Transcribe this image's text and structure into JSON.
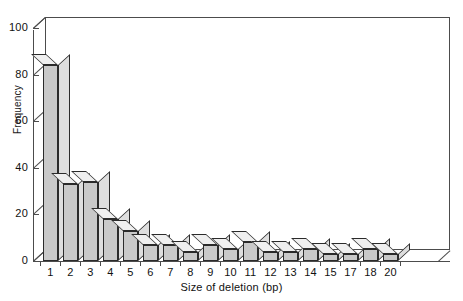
{
  "chart_data": {
    "type": "bar",
    "title": "",
    "xlabel": "Size of deletion (bp)",
    "ylabel": "Frequency",
    "categories": [
      "1",
      "2",
      "3",
      "4",
      "5",
      "6",
      "7",
      "8",
      "9",
      "10",
      "11",
      "12",
      "13",
      "14",
      "15",
      "17",
      "18",
      "20"
    ],
    "values": [
      84,
      33,
      34,
      18,
      13,
      7,
      7,
      4,
      7,
      5,
      8,
      4,
      4,
      5,
      3,
      3,
      5,
      3
    ],
    "ylim": [
      0,
      100
    ],
    "yticks": [
      0,
      20,
      40,
      60,
      80,
      100
    ],
    "ytick_labels": [
      "0",
      "20",
      "40",
      "60",
      "80",
      "100"
    ],
    "grid": "horizontal",
    "legend": "none",
    "style": "3d-bar",
    "colors": {
      "bar_front": "#c9c9c9",
      "bar_top": "#efefef",
      "bar_side": "#dedede",
      "bar_outline": "#2b2b2b",
      "axis": "#4c4c4c",
      "gridline": "#6e6e6e",
      "background": "#ffffff",
      "text": "#111111"
    }
  }
}
